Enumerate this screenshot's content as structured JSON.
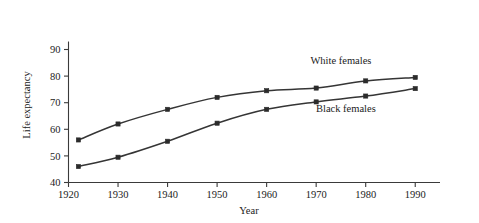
{
  "chart_data": {
    "type": "line",
    "title": "",
    "xlabel": "Year",
    "ylabel": "Life expectancy",
    "x": [
      1922,
      1930,
      1940,
      1950,
      1960,
      1970,
      1980,
      1990
    ],
    "xlim": [
      1920,
      1995
    ],
    "ylim": [
      40,
      93
    ],
    "xticks": [
      1920,
      1930,
      1940,
      1950,
      1960,
      1970,
      1980,
      1990
    ],
    "xtick_labels": [
      "1920",
      "1930",
      "1940",
      "1950",
      "1960",
      "1970",
      "1980",
      "1990"
    ],
    "yticks": [
      40,
      50,
      60,
      70,
      80,
      90
    ],
    "ytick_labels": [
      "40",
      "50",
      "60",
      "70",
      "80",
      "90"
    ],
    "grid": false,
    "legend_position": "inline-annotation",
    "series": [
      {
        "name": "White females",
        "color": "#353535",
        "marker": "square",
        "values": [
          56.0,
          62.0,
          67.5,
          72.0,
          74.5,
          75.5,
          78.2,
          79.5
        ],
        "annotation": {
          "text": "White females",
          "x": 1975,
          "y": 84.5
        }
      },
      {
        "name": "Black females",
        "color": "#353535",
        "marker": "square",
        "values": [
          46.0,
          49.5,
          55.5,
          62.3,
          67.5,
          70.3,
          72.5,
          75.3
        ],
        "annotation": {
          "text": "Black females",
          "x": 1976,
          "y": 66.5
        }
      }
    ]
  },
  "labels": {
    "y_axis_title": "Life expectancy",
    "x_axis_title": "Year",
    "series_white": "White females",
    "series_black": "Black females"
  }
}
